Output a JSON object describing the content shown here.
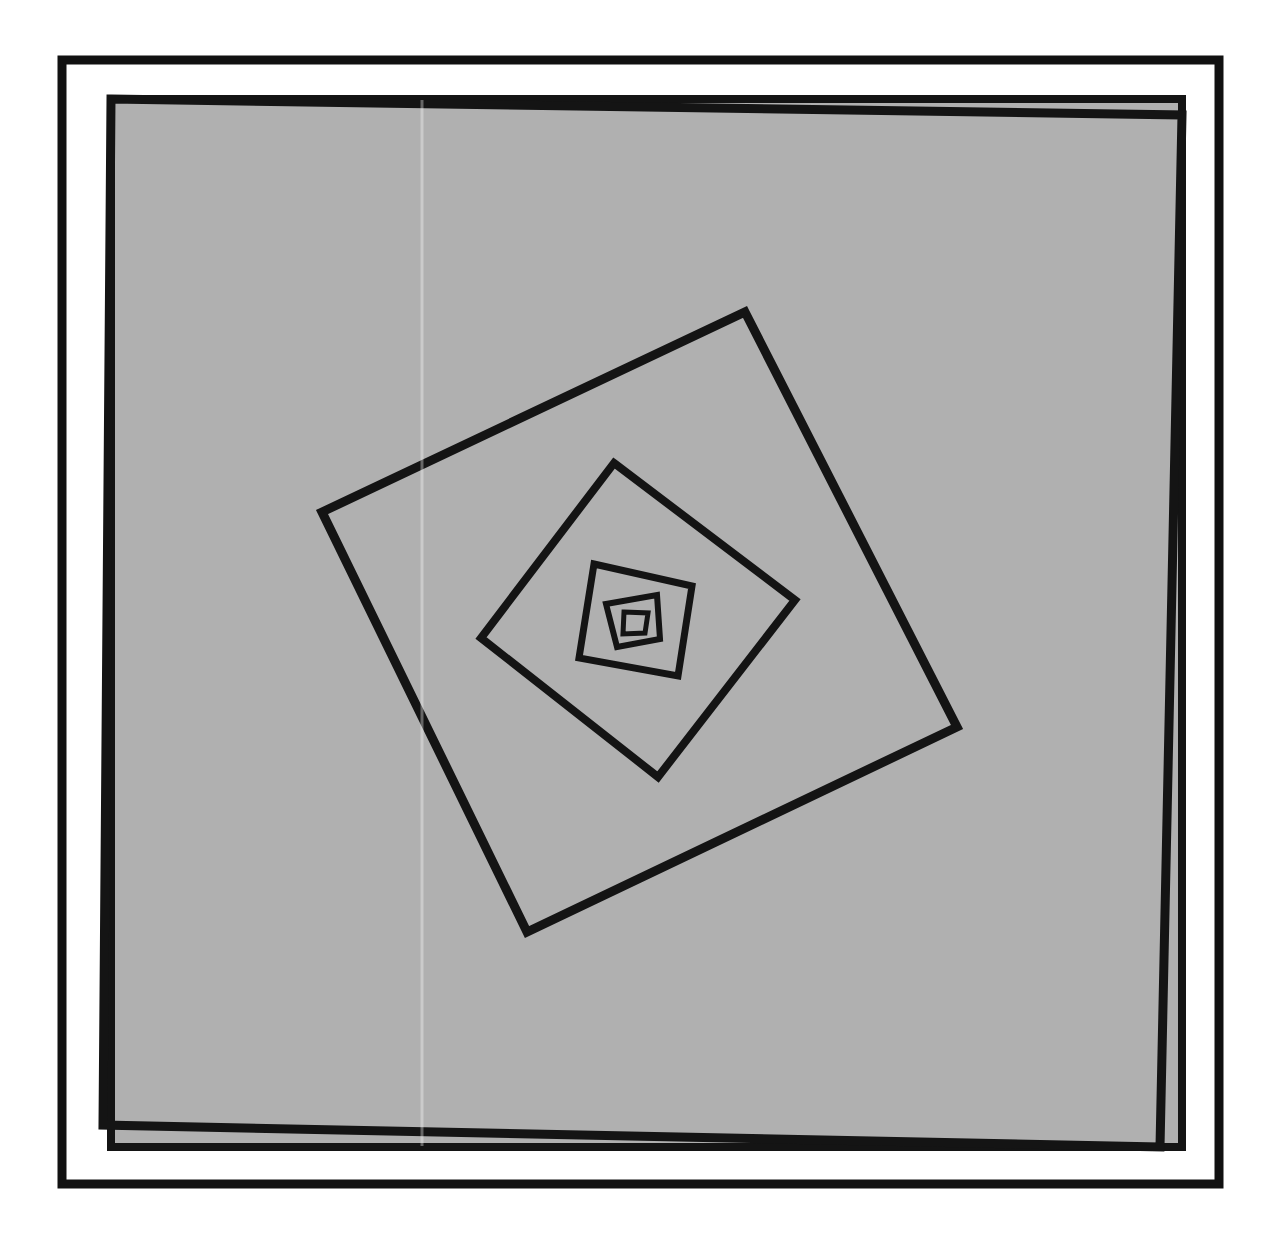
{
  "figure": {
    "title": "Nested Rotating Quadrilaterals Spiral",
    "medium": "halftone print on paper",
    "canvas": {
      "width": 1276,
      "height": 1246
    },
    "colors": {
      "paper": "#ffffff",
      "frame_black": "#111111",
      "mat_white": "#ffffff",
      "field_gray": "#b0b0b0",
      "line_black": "#141414"
    },
    "frame": {
      "outer_border": {
        "x": 62,
        "y": 60,
        "width": 1157,
        "height": 1124,
        "stroke_width": 9
      },
      "mat_gap": 22,
      "inner_field_border_stroke": 8
    },
    "field": {
      "name": "gray-field",
      "x": 111,
      "y": 99,
      "width": 1071,
      "height": 1048,
      "fill": "#b0b0b0"
    },
    "line_style": {
      "stroke": "#141414",
      "stroke_width_outer": 9,
      "stroke_width_inner": 6,
      "linejoin": "miter",
      "linecap": "butt"
    }
  },
  "chart_data": {
    "type": "line",
    "title": "Nested Rotating Quadrilaterals Spiral",
    "subtitle": "Whirling squares construction",
    "xlabel": "",
    "ylabel": "",
    "grid": false,
    "legend_position": "none",
    "xlim": [
      0,
      1276
    ],
    "ylim": [
      0,
      1246
    ],
    "construction": {
      "rule": "each successive quadrilateral connects points at a constant fraction t along each edge of the previous quadrilateral, in the same rotational direction",
      "fraction_t": 0.38,
      "rotation": "clockwise-inward",
      "levels": 6
    },
    "series": [
      {
        "name": "quad-1-outer",
        "closed": true,
        "stroke_width": 9,
        "points": [
          [
            111,
            99
          ],
          [
            1182,
            115
          ],
          [
            1160,
            1147
          ],
          [
            103,
            1125
          ]
        ]
      },
      {
        "name": "quad-2",
        "closed": true,
        "stroke_width": 9,
        "points": [
          [
            745,
            312
          ],
          [
            957,
            727
          ],
          [
            527,
            932
          ],
          [
            322,
            512
          ]
        ]
      },
      {
        "name": "quad-3",
        "closed": true,
        "stroke_width": 8,
        "points": [
          [
            614,
            463
          ],
          [
            795,
            600
          ],
          [
            658,
            777
          ],
          [
            481,
            638
          ]
        ]
      },
      {
        "name": "quad-4",
        "closed": true,
        "stroke_width": 7,
        "points": [
          [
            594,
            564
          ],
          [
            692,
            586
          ],
          [
            678,
            676
          ],
          [
            579,
            658
          ]
        ]
      },
      {
        "name": "quad-5",
        "closed": true,
        "stroke_width": 6,
        "points": [
          [
            606,
            604
          ],
          [
            657,
            595
          ],
          [
            660,
            639
          ],
          [
            617,
            647
          ]
        ]
      },
      {
        "name": "quad-6-inner",
        "closed": true,
        "stroke_width": 5,
        "points": [
          [
            624,
            612
          ],
          [
            648,
            613
          ],
          [
            645,
            633
          ],
          [
            623,
            634
          ]
        ]
      }
    ],
    "annotations": []
  }
}
